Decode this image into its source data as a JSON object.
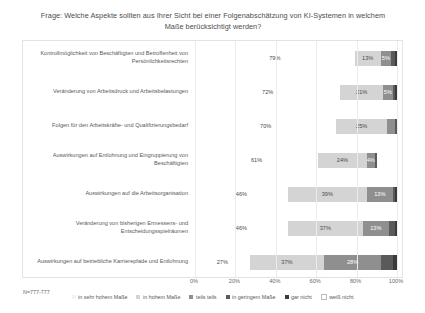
{
  "chart_data": {
    "type": "bar",
    "subtype": "stacked-horizontal-100",
    "title": "Frage: Welche Aspekte sollten aus Ihrer Sicht bei einer Folgenabschätzung von KI-Systemen in welchem Maße berücksichtigt werden?",
    "xlabel": "",
    "ylabel": "",
    "xlim": [
      0,
      100
    ],
    "xticks": [
      "0%",
      "20%",
      "40%",
      "60%",
      "80%",
      "100%"
    ],
    "xtick_values": [
      0,
      20,
      40,
      60,
      80,
      100
    ],
    "grid": true,
    "legend_position": "bottom",
    "note": "N=777-777",
    "categories": [
      "Kontrollmöglichkeit von Beschäftigten und Betroffenheit von Persönlichkeitsrechten",
      "Veränderung von Arbeitsdruck und Arbeitsbelastungen",
      "Folgen für den Arbeitskräfte- und Qualifizierungsbedarf",
      "Auswirkungen auf Entlohnung und Eingruppierung von Beschäftigten",
      "Auswirkungen auf die Arbeitsorganisation",
      "Veränderung von bisherigen Ermessens- und Entscheidungsspielräumen",
      "Auswirkungen auf betriebliche Karrierepfade und Entlohnung"
    ],
    "series": [
      {
        "name": "in sehr hohem Maße",
        "color": "#f2f2f2",
        "values": [
          79,
          72,
          70,
          61,
          46,
          46,
          27
        ],
        "labels": [
          "79%",
          "72%",
          "70%",
          "61%",
          "46%",
          "46%",
          "27%"
        ]
      },
      {
        "name": "in hohem Maße",
        "color": "#d4d4d4",
        "values": [
          13,
          21,
          25,
          24,
          39,
          37,
          37
        ],
        "labels": [
          "13%",
          "21%",
          "25%",
          "24%",
          "39%",
          "37%",
          "37%"
        ]
      },
      {
        "name": "teils teils",
        "color": "#8f8f8f",
        "values": [
          5,
          5,
          4,
          4,
          13,
          13,
          28
        ],
        "labels": [
          "5%",
          "5%",
          "",
          "4%",
          "13%",
          "13%",
          "28%"
        ]
      },
      {
        "name": "in geringem Maße",
        "color": "#5a5a5a",
        "values": [
          2,
          1,
          1,
          1,
          1,
          3,
          6
        ],
        "labels": [
          "",
          "",
          "",
          "",
          "",
          "",
          ""
        ]
      },
      {
        "name": "gar nicht",
        "color": "#3b3b3b",
        "values": [
          1,
          1,
          0,
          0,
          1,
          1,
          2
        ],
        "labels": [
          "",
          "",
          "",
          "",
          "",
          "",
          ""
        ]
      },
      {
        "name": "weiß nicht",
        "color": "#ffffff",
        "values": [
          0,
          0,
          0,
          10,
          0,
          0,
          0
        ],
        "labels": [
          "",
          "",
          "",
          "",
          "",
          "",
          ""
        ]
      }
    ]
  }
}
